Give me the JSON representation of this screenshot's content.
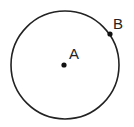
{
  "diagram": {
    "type": "geometry-circle",
    "circle": {
      "cx": 65,
      "cy": 65,
      "r": 54,
      "stroke": "#222222"
    },
    "points": [
      {
        "label": "A",
        "x": 64,
        "y": 65,
        "role": "center"
      },
      {
        "label": "B",
        "x": 110,
        "y": 34,
        "role": "on-circle"
      }
    ]
  }
}
